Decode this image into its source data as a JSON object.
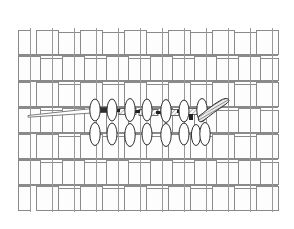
{
  "figure": {
    "caption": "Fig 4",
    "caption_color": "#7d7d7d",
    "background_color": "#ffffff",
    "width": 294,
    "height": 229
  },
  "drawing": {
    "subject": "woven-mesh-fabric-with-suture-and-needle",
    "line_color": "#8a8a8a",
    "dark_line_color": "#3a3a3a",
    "shade_color": "#9b9b9b",
    "fill_color": "#ffffff",
    "stroke_width": 1
  },
  "weave": {
    "label": "plain-weave-mesh",
    "left": 18,
    "top": 28,
    "right": 278,
    "bottom": 211,
    "columns": 12,
    "rows": 7,
    "cell_width": 22,
    "cell_height": 26,
    "gap": 4,
    "strand_color": "#8a8a8a",
    "strand_fill": "#fdfdfd"
  },
  "suture": {
    "label": "suture-thread",
    "center_y": 113,
    "tail_start_x": 28,
    "tail_end_x": 92,
    "body_start_x": 92,
    "body_end_x": 206,
    "thread_color": "#3a3a3a",
    "hatch_color": "#9b9b9b",
    "segments": 6
  },
  "lifted_strands": {
    "label": "lifted-warp-ellipses",
    "upper_row_y": 110,
    "lower_row_y": 135,
    "ellipse_rx": 5,
    "ellipse_ry": 11,
    "upper_count": 7,
    "lower_count": 8,
    "start_x": 94,
    "spacing": 18,
    "stroke_color": "#2f2f2f",
    "fill_color": "#ffffff"
  },
  "needle": {
    "label": "curved-surgical-needle",
    "tip_x": 228,
    "tip_y": 100,
    "base_x": 200,
    "base_y": 116,
    "shade_color": "#777777",
    "outline_color": "#2f2f2f"
  }
}
